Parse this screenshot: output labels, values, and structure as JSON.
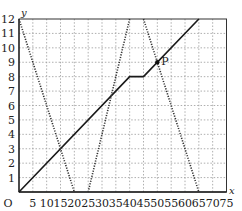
{
  "chart_data": {
    "type": "line",
    "title": "",
    "xlabel": "x",
    "ylabel": "y",
    "origin_label": "O",
    "xlim": [
      0,
      75
    ],
    "ylim": [
      0,
      12
    ],
    "grid": true,
    "x_ticks": [
      5,
      10,
      15,
      20,
      25,
      30,
      35,
      40,
      45,
      50,
      55,
      60,
      65,
      70,
      75
    ],
    "y_ticks": [
      1,
      2,
      3,
      4,
      5,
      6,
      7,
      8,
      9,
      10,
      11,
      12
    ],
    "series": [
      {
        "name": "solid-line",
        "style": "solid",
        "points": [
          [
            0,
            0
          ],
          [
            40,
            8
          ],
          [
            45,
            8
          ],
          [
            65,
            12
          ]
        ]
      },
      {
        "name": "dotted-line-1",
        "style": "dotted",
        "points": [
          [
            0,
            12
          ],
          [
            20,
            0
          ]
        ]
      },
      {
        "name": "dotted-line-2",
        "style": "dotted",
        "points": [
          [
            25,
            0
          ],
          [
            40,
            12
          ]
        ]
      },
      {
        "name": "dotted-line-3",
        "style": "dotted",
        "points": [
          [
            45,
            12
          ],
          [
            65,
            0
          ]
        ]
      }
    ],
    "annotations": [
      {
        "label": "P",
        "x": 50,
        "y": 9
      }
    ]
  }
}
